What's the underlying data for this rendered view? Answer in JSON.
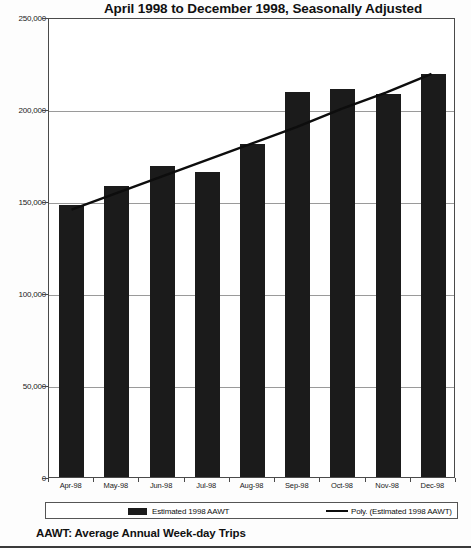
{
  "chart_data": {
    "type": "bar",
    "title": "April 1998 to December 1998, Seasonally Adjusted",
    "xlabel": "",
    "ylabel": "",
    "ylim": [
      0,
      250000
    ],
    "grid": true,
    "legend_position": "bottom",
    "categories": [
      "Apr-98",
      "May-98",
      "Jun-98",
      "Jul-98",
      "Aug-98",
      "Sep-98",
      "Oct-98",
      "Nov-98",
      "Dec-98"
    ],
    "ytick_labels": [
      "0",
      "50,000",
      "100,000",
      "150,000",
      "200,000",
      "250,000"
    ],
    "ytick_values": [
      0,
      50000,
      100000,
      150000,
      200000,
      250000
    ],
    "series": [
      {
        "name": "Estimated 1998 AAWT",
        "type": "bar",
        "color": "#1b1b1b",
        "values": [
          148000,
          158000,
          169000,
          166000,
          181000,
          209000,
          211000,
          208000,
          219000
        ]
      },
      {
        "name": "Poly. (Estimated 1998 AAWT)",
        "type": "line",
        "color": "#0d0d0d",
        "values": [
          146000,
          155000,
          164000,
          173000,
          182000,
          191000,
          201000,
          210000,
          220000
        ]
      }
    ],
    "annotations": [
      "AAWT:  Average Annual Week-day Trips"
    ]
  },
  "legend": {
    "bar_label": "Estimated 1998 AAWT",
    "line_label": "Poly. (Estimated 1998 AAWT)"
  },
  "footnote": {
    "text": "AAWT:  Average Annual Week-day Trips"
  }
}
